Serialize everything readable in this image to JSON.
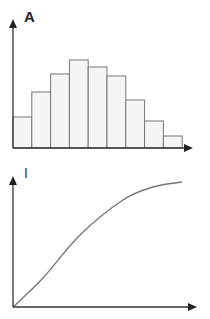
{
  "figure": {
    "panels": [
      {
        "label": "A",
        "type": "bar"
      },
      {
        "label": "I",
        "type": "line"
      }
    ]
  },
  "colors": {
    "axis": "#333333",
    "bar_fill": "#f5f5f5",
    "bar_stroke": "#777777",
    "curve": "#777777"
  },
  "chart_data": [
    {
      "type": "bar",
      "title": "A",
      "xlabel": "",
      "ylabel": "A",
      "categories": [
        "1",
        "2",
        "3",
        "4",
        "5",
        "6",
        "7",
        "8",
        "9"
      ],
      "values": [
        31,
        56,
        74,
        88,
        81,
        72,
        48,
        27,
        12
      ],
      "grid": false,
      "legend": null,
      "notes": "Histogram-like distribution with no tick labels; values are relative bar heights in pixels above the x-axis."
    },
    {
      "type": "line",
      "title": "I",
      "xlabel": "",
      "ylabel": "I",
      "x": [
        0,
        30,
        67,
        110,
        140,
        169
      ],
      "y": [
        0,
        29,
        72,
        107,
        120,
        125
      ],
      "grid": false,
      "legend": null,
      "notes": "Saturating S-shaped curve starting at origin, no tick labels; values are relative pixel coordinates."
    }
  ]
}
